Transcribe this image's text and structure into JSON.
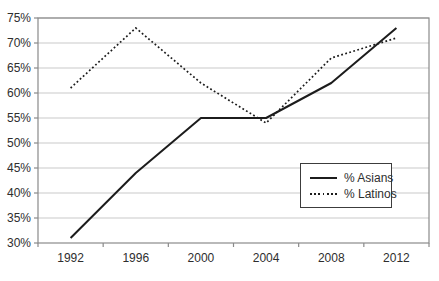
{
  "chart_data": {
    "type": "line",
    "title": "",
    "xlabel": "",
    "ylabel": "",
    "categories": [
      "1992",
      "1996",
      "2000",
      "2004",
      "2008",
      "2012"
    ],
    "series": [
      {
        "name": "% Asians",
        "line_style": "solid",
        "values": [
          31,
          44,
          55,
          55,
          62,
          73
        ]
      },
      {
        "name": "% Latinos",
        "line_style": "dotted",
        "values": [
          61,
          73,
          62,
          54,
          67,
          71
        ]
      }
    ],
    "ylim": [
      30,
      75
    ],
    "y_tick_step": 5,
    "y_tick_labels": [
      "30%",
      "35%",
      "40%",
      "45%",
      "50%",
      "55%",
      "60%",
      "65%",
      "70%",
      "75%"
    ],
    "grid": true,
    "legend_position": "middle-right",
    "colors": {
      "line": "#1c1c1c",
      "grid": "#c9c9c9",
      "frame": "#8a8a8a",
      "text": "#2e2e2e",
      "background": "#ffffff"
    }
  }
}
